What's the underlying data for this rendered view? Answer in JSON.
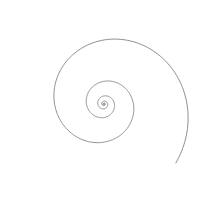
{
  "diagram": {
    "type": "spiral",
    "stroke_color": "#808080",
    "background": "#ffffff",
    "center": [
      104,
      104
    ],
    "turns": 5.2,
    "outer_radius": 93,
    "growth": 0.19
  }
}
